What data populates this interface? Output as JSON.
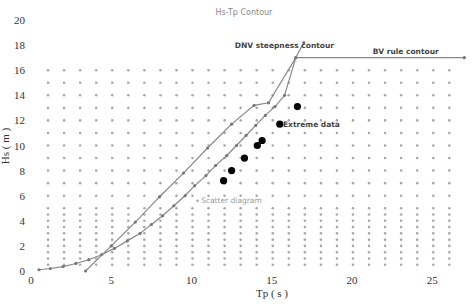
{
  "chart_data": {
    "type": "scatter",
    "title": "Hs-Tp Contour",
    "xlabel": "Tp ( s )",
    "ylabel": "Hs ( m )",
    "xlim": [
      0,
      27
    ],
    "ylim": [
      0,
      20
    ],
    "x_ticks": [
      0,
      5,
      10,
      15,
      20,
      25
    ],
    "y_ticks": [
      0,
      2,
      4,
      6,
      8,
      10,
      12,
      14,
      16,
      18,
      20
    ],
    "grid": false,
    "legend": "inline annotations",
    "annotations": [
      {
        "text": "DNV steepness contour",
        "x": 12.7,
        "y": 17.8
      },
      {
        "text": "BV rule contour",
        "x": 21.3,
        "y": 17.3
      },
      {
        "text": "Extreme data",
        "x": 15.7,
        "y": 11.5
      },
      {
        "text": "Scatter diagram",
        "x": 10.6,
        "y": 5.4
      }
    ],
    "series": [
      {
        "name": "Scatter diagram",
        "style": "grid of small gray dots",
        "tp_values": [
          1,
          2,
          3,
          4,
          5,
          6,
          7,
          8,
          9,
          10,
          11,
          12,
          13,
          14,
          15,
          16,
          17,
          18,
          19,
          20,
          21,
          22,
          23,
          24,
          25,
          26
        ],
        "hs_values": [
          0.5,
          1,
          1.5,
          2,
          2.5,
          3,
          3.5,
          4,
          4.5,
          5,
          6,
          7,
          8,
          9,
          10,
          11,
          12,
          13,
          14,
          15,
          16
        ],
        "color": "#a8a8a8"
      },
      {
        "name": "BV rule contour",
        "style": "line with markers",
        "color": "#888888",
        "points": [
          [
            0.5,
            0.1
          ],
          [
            1.2,
            0.2
          ],
          [
            2.0,
            0.35
          ],
          [
            2.8,
            0.6
          ],
          [
            3.6,
            0.9
          ],
          [
            4.4,
            1.3
          ],
          [
            5.2,
            1.8
          ],
          [
            6.0,
            2.4
          ],
          [
            6.8,
            3.0
          ],
          [
            7.5,
            3.7
          ],
          [
            8.2,
            4.4
          ],
          [
            8.9,
            5.2
          ],
          [
            9.6,
            6.0
          ],
          [
            10.2,
            6.8
          ],
          [
            10.9,
            7.6
          ],
          [
            11.5,
            8.4
          ],
          [
            12.2,
            9.2
          ],
          [
            12.8,
            10.0
          ],
          [
            13.4,
            10.8
          ],
          [
            14.0,
            11.6
          ],
          [
            14.6,
            12.4
          ],
          [
            15.2,
            13.1
          ],
          [
            15.8,
            14.0
          ],
          [
            16.5,
            17.0
          ],
          [
            27.0,
            17.0
          ]
        ]
      },
      {
        "name": "DNV steepness contour",
        "style": "line with markers",
        "color": "#888888",
        "points": [
          [
            3.4,
            0.0
          ],
          [
            5.0,
            2.0
          ],
          [
            6.5,
            3.9
          ],
          [
            8.0,
            5.9
          ],
          [
            9.5,
            7.8
          ],
          [
            11.0,
            9.8
          ],
          [
            12.5,
            11.7
          ],
          [
            13.9,
            13.2
          ],
          [
            14.8,
            13.4
          ],
          [
            16.5,
            17.0
          ],
          [
            17.0,
            18.2
          ]
        ]
      },
      {
        "name": "Extreme data",
        "style": "large black dots",
        "color": "#000000",
        "points": [
          [
            12.0,
            7.2
          ],
          [
            12.5,
            8.0
          ],
          [
            13.3,
            9.0
          ],
          [
            14.1,
            10.0
          ],
          [
            14.4,
            10.4
          ],
          [
            15.5,
            11.7
          ],
          [
            16.6,
            13.1
          ]
        ]
      }
    ]
  }
}
